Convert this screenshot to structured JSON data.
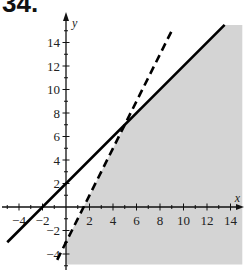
{
  "title": "34.",
  "chart_data": {
    "type": "line",
    "title": "34.",
    "xlabel": "x",
    "ylabel": "y",
    "xlim": [
      -5,
      15
    ],
    "ylim": [
      -5,
      15.5
    ],
    "x_ticks": [
      -4,
      -2,
      2,
      4,
      6,
      8,
      10,
      12,
      14
    ],
    "y_ticks": [
      -4,
      -2,
      2,
      4,
      6,
      8,
      10,
      12,
      14
    ],
    "grid": false,
    "series": [
      {
        "name": "solid boundary",
        "style": "solid",
        "equation": "y = x + 2",
        "x": [
          -5,
          13.5
        ],
        "y": [
          -3,
          15.5
        ]
      },
      {
        "name": "dashed boundary",
        "style": "dashed",
        "equation": "y = 2x - 3",
        "x": [
          -0.75,
          9.1
        ],
        "y": [
          -4.5,
          15.2
        ]
      }
    ],
    "shaded_region": {
      "description": "x >= 0, y <= x + 2, y < 2x - 3",
      "vertices": [
        [
          0,
          -4.9
        ],
        [
          15,
          -4.9
        ],
        [
          15,
          15.5
        ],
        [
          13.5,
          15.5
        ],
        [
          5,
          7
        ],
        [
          0,
          -3
        ]
      ],
      "color": "#d4d4d4"
    },
    "intersection": [
      5,
      7
    ]
  }
}
